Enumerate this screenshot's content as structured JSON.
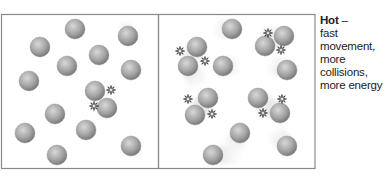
{
  "caption": {
    "title": "Hot",
    "dash": " –",
    "lines": [
      "fast movement,",
      "more collisions,",
      "more energy"
    ]
  },
  "colors": {
    "frame": "#8a8a8a",
    "particle_light": "#d4d4d4",
    "particle_dark": "#7f7f7f",
    "motion_trail": "#e6e6e6",
    "collision_mark": "#333333"
  },
  "panels": [
    {
      "name": "cold-panel",
      "x": 1,
      "y": 14,
      "w": 157,
      "h": 154
    },
    {
      "name": "hot-panel",
      "x": 158,
      "y": 14,
      "w": 157,
      "h": 154
    }
  ],
  "particles_left": [
    [
      75,
      29
    ],
    [
      40,
      47
    ],
    [
      128,
      36
    ],
    [
      99,
      55
    ],
    [
      67,
      66
    ],
    [
      131,
      70
    ],
    [
      29,
      81
    ],
    [
      95,
      91
    ],
    [
      107,
      108
    ],
    [
      55,
      114
    ],
    [
      86,
      130
    ],
    [
      25,
      133
    ],
    [
      57,
      155
    ],
    [
      131,
      146
    ]
  ],
  "particles_right": [
    [
      232,
      29
    ],
    [
      197,
      47
    ],
    [
      188,
      66
    ],
    [
      284,
      36
    ],
    [
      265,
      46
    ],
    [
      223,
      66
    ],
    [
      287,
      70
    ],
    [
      208,
      98
    ],
    [
      195,
      115
    ],
    [
      258,
      98
    ],
    [
      280,
      113
    ],
    [
      240,
      133
    ],
    [
      213,
      155
    ],
    [
      287,
      146
    ]
  ]
}
